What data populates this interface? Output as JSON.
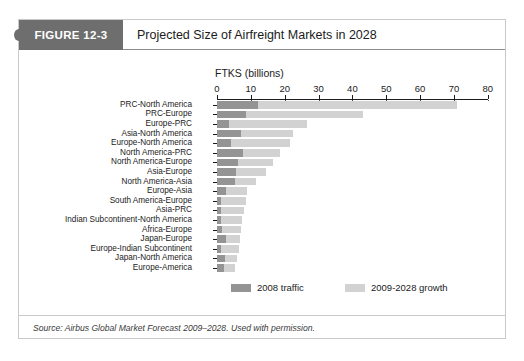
{
  "figure": {
    "tab_label": "FIGURE 12-3",
    "title": "Projected Size of Airfreight Markets in 2028",
    "source": "Source: Airbus Global Market Forecast 2009–2028. Used with permission."
  },
  "legend": {
    "items": [
      {
        "label": "2008 traffic",
        "color": "#949494"
      },
      {
        "label": "2009-2028 growth",
        "color": "#d2d2d2"
      }
    ]
  },
  "colors": {
    "header_tab": "#6e6e6e",
    "traffic_2008": "#949494",
    "growth_2009_2028": "#d2d2d2",
    "axis": "#1b1b1b",
    "card_border": "#c9c9c9"
  },
  "chart_data": {
    "type": "bar",
    "orientation": "horizontal",
    "stacked": true,
    "title": "Projected Size of Airfreight Markets in 2028",
    "xlabel": "FTKS (billions)",
    "ylabel": "",
    "xlim": [
      0,
      80
    ],
    "xticks": [
      0,
      10,
      20,
      30,
      40,
      50,
      60,
      70,
      80
    ],
    "xticklabels": [
      "0",
      "10",
      "20",
      "30",
      "40",
      "50",
      "60",
      "70",
      "80"
    ],
    "grid": "vertical-dashed",
    "legend_position": "bottom",
    "categories": [
      "PRC-North America",
      "PRC-Europe",
      "Europe-PRC",
      "Asia-North America",
      "Europe-North America",
      "North America-PRC",
      "North America-Europe",
      "Asia-Europe",
      "North America-Asia",
      "Europe-Asia",
      "South America-Europe",
      "Asia-PRC",
      "Indian Subcontinent-North America",
      "Africa-Europe",
      "Japan-Europe",
      "Europe-Indian Subcontinent",
      "Japan-North America",
      "Europe-America"
    ],
    "series": [
      {
        "name": "2008 traffic",
        "color": "#949494",
        "values": [
          12.0,
          8.6,
          3.4,
          7.2,
          4.1,
          7.7,
          6.3,
          5.5,
          5.3,
          2.8,
          1.3,
          1.2,
          1.2,
          1.5,
          2.6,
          1.2,
          2.4,
          2.0
        ]
      },
      {
        "name": "2009-2028 growth",
        "color": "#d2d2d2",
        "values": [
          59.0,
          34.4,
          23.1,
          15.3,
          17.6,
          11.0,
          10.3,
          9.0,
          6.3,
          6.1,
          7.3,
          6.7,
          6.3,
          5.6,
          4.1,
          5.3,
          3.4,
          3.4
        ]
      }
    ],
    "totals": [
      71.0,
      43.0,
      26.5,
      22.5,
      21.7,
      18.7,
      16.6,
      14.5,
      11.6,
      8.9,
      8.6,
      7.9,
      7.5,
      7.1,
      6.7,
      6.5,
      5.8,
      5.4
    ]
  }
}
